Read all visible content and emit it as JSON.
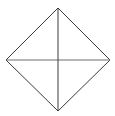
{
  "figure": {
    "canvas": {
      "width": 115,
      "height": 116,
      "background_color": "#ffffff"
    },
    "shape": {
      "name": "diamond",
      "type": "rhombus",
      "description": "Square rotated 45 degrees (diamond) outline",
      "stroke_color": "#3a3a3a",
      "stroke_width": 1,
      "fill_color": "none",
      "vertices": {
        "top": {
          "x": 58,
          "y": 8
        },
        "right": {
          "x": 110,
          "y": 60
        },
        "bottom": {
          "x": 58,
          "y": 111
        },
        "left": {
          "x": 6,
          "y": 60
        }
      },
      "points_path": "58,8 110,60 58,111 6,60"
    },
    "diagonals": {
      "vertical": {
        "name": "vertical-diagonal",
        "from": {
          "x": 58,
          "y": 8
        },
        "to": {
          "x": 58,
          "y": 111
        },
        "stroke_color": "#3a3a3a",
        "stroke_width": 1
      },
      "horizontal": {
        "name": "horizontal-diagonal",
        "from": {
          "x": 6,
          "y": 60
        },
        "to": {
          "x": 110,
          "y": 60
        },
        "stroke_color": "#6e6e6e",
        "stroke_width": 1
      }
    },
    "center": {
      "x": 58,
      "y": 60
    }
  }
}
